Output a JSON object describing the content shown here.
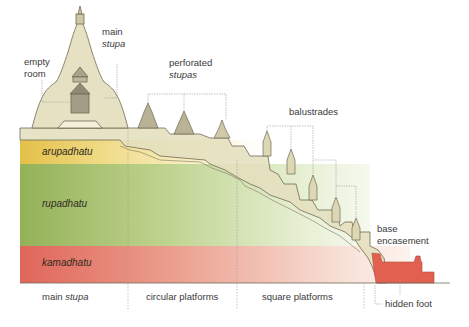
{
  "diagram": {
    "type": "cross-section",
    "colors": {
      "stone": "#e4dfbe",
      "stone_outline": "#6f6a55",
      "arupadhatu": "#e7c75a",
      "rupadhatu": "#9ab55c",
      "kamadhatu": "#e0695a",
      "base_encasement": "#e2604f",
      "leader_line": "#8e8e8e",
      "text": "#3a3a3a"
    },
    "callouts": {
      "empty_room": {
        "line1": "empty",
        "line2": "room"
      },
      "main_stupa": {
        "line1": "main",
        "line2": "stupa"
      },
      "perforated_stupas": {
        "line1": "perforated",
        "line2": "stupas"
      },
      "balustrades": {
        "label": "balustrades"
      },
      "base_encasement": {
        "line1": "base",
        "line2": "encasement"
      },
      "hidden_foot": {
        "label": "hidden foot"
      }
    },
    "zones": [
      {
        "id": "arupadhatu",
        "label": "arupadhatu"
      },
      {
        "id": "rupadhatu",
        "label": "rupadhatu"
      },
      {
        "id": "kamadhatu",
        "label": "kamadhatu"
      }
    ],
    "sections": [
      {
        "id": "main-stupa",
        "label_prefix": "main ",
        "label_italic": "stupa"
      },
      {
        "id": "circular-platforms",
        "label": "circular platforms"
      },
      {
        "id": "square-platforms",
        "label": "square platforms"
      }
    ]
  }
}
